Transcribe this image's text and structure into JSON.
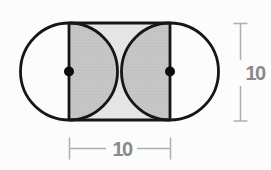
{
  "figure": {
    "type": "geometry-diagram",
    "dimension_labels": {
      "bottom_width": "10",
      "right_height": "10"
    },
    "colors": {
      "outline": "#161616",
      "square_fill": "#e5e5e5",
      "semicircle_fill": "#c7c7c7",
      "stipple_dot": "#b0b0b0",
      "dimension_line": "#aeaeae",
      "dimension_text": "#8a8a8a",
      "center_dot": "#0d0d0d",
      "background": "#fcfcfc"
    }
  }
}
